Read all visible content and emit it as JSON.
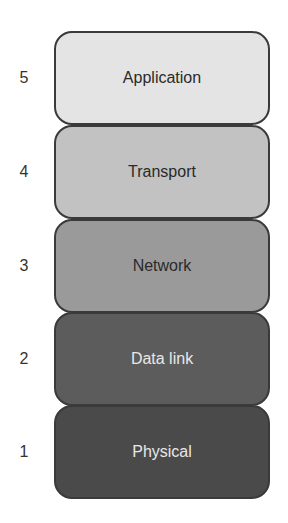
{
  "diagram": {
    "title": "",
    "layers": [
      {
        "number": "5",
        "label": "Application",
        "fill": "#e4e4e4",
        "text_color": "#2a2a2a"
      },
      {
        "number": "4",
        "label": "Transport",
        "fill": "#c2c2c2",
        "text_color": "#2a2a2a"
      },
      {
        "number": "3",
        "label": "Network",
        "fill": "#9a9a9a",
        "text_color": "#2a2a2a"
      },
      {
        "number": "2",
        "label": "Data link",
        "fill": "#5c5c5c",
        "text_color": "#e8e8e8"
      },
      {
        "number": "1",
        "label": "Physical",
        "fill": "#4a4a4a",
        "text_color": "#e8e8e8"
      }
    ]
  }
}
